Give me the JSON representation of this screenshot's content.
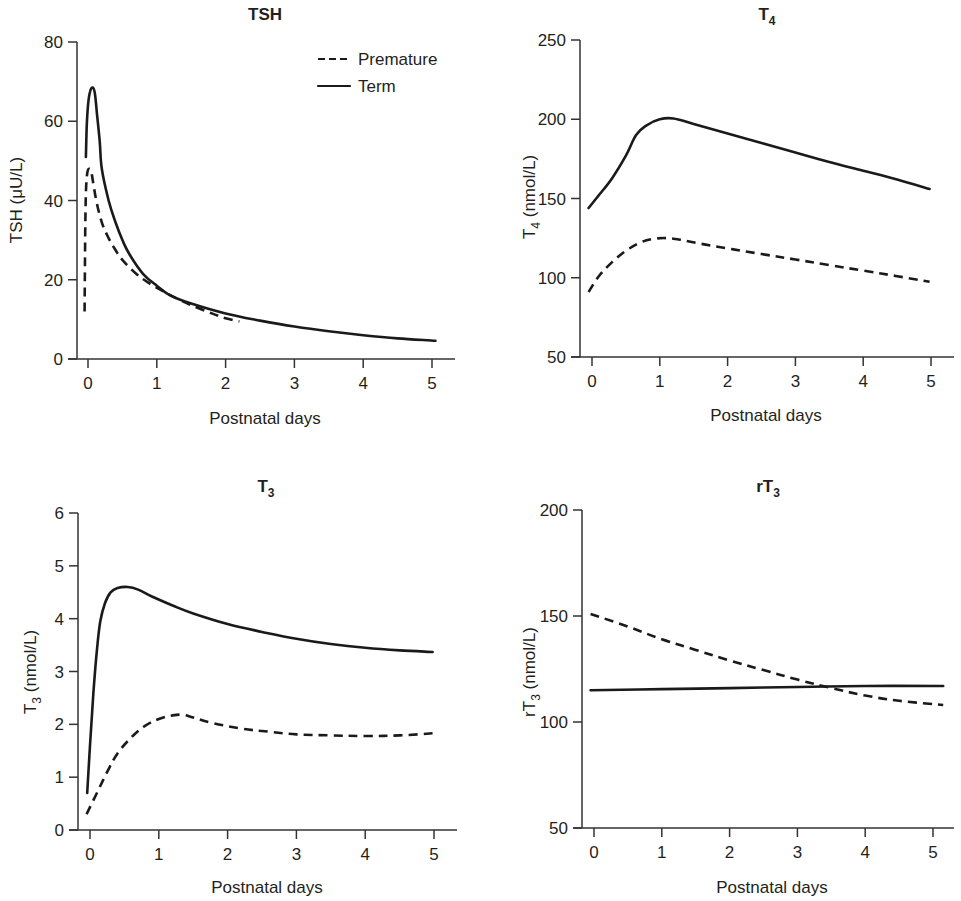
{
  "chart_data": [
    {
      "id": "tsh",
      "type": "line",
      "title": "TSH",
      "title_sub": "",
      "xlabel": "Postnatal days",
      "ylabel": "TSH (μU/L)",
      "ylabel_main": "TSH (",
      "ylabel_sub": "",
      "ylabel_rest": "μU/L)",
      "xlim": [
        0,
        5
      ],
      "ylim": [
        0,
        80
      ],
      "xticks": [
        0,
        1,
        2,
        3,
        4,
        5
      ],
      "yticks": [
        0,
        20,
        40,
        60,
        80
      ],
      "grid": false,
      "legend": {
        "position": "upper right",
        "entries": [
          {
            "label": "Premature",
            "style": "dashed"
          },
          {
            "label": "Term",
            "style": "solid"
          }
        ]
      },
      "series": [
        {
          "name": "Term",
          "style": "solid",
          "x": [
            -0.03,
            -0.02,
            0.0,
            0.03,
            0.07,
            0.1,
            0.13,
            0.17,
            0.2,
            0.3,
            0.4,
            0.5,
            0.6,
            0.8,
            1.0,
            1.2,
            1.5,
            2.0,
            2.5,
            3.0,
            3.5,
            4.0,
            4.5,
            5.05
          ],
          "y": [
            51,
            58,
            64,
            67.5,
            68.5,
            67,
            62,
            55,
            48,
            40,
            34.5,
            30,
            26.5,
            21.5,
            18.5,
            16,
            14,
            11.5,
            9.7,
            8.2,
            7,
            6,
            5.2,
            4.6
          ]
        },
        {
          "name": "Premature",
          "style": "dashed",
          "x": [
            -0.05,
            -0.045,
            -0.04,
            -0.03,
            -0.01,
            0.02,
            0.05,
            0.08,
            0.12,
            0.2,
            0.3,
            0.4,
            0.5,
            0.7,
            0.9,
            1.1,
            1.3,
            1.5,
            1.8,
            2.0,
            2.2
          ],
          "y": [
            12,
            22,
            32,
            42,
            47,
            48,
            47,
            44,
            40,
            34.5,
            30.5,
            27.5,
            25,
            21.5,
            19,
            17,
            15.2,
            13.6,
            11.5,
            10.3,
            9.5
          ]
        }
      ]
    },
    {
      "id": "t4",
      "type": "line",
      "title": "T",
      "title_sub": "4",
      "xlabel": "Postnatal days",
      "ylabel": "T4 (nmol/L)",
      "ylabel_main": "T",
      "ylabel_sub": "4",
      "ylabel_rest": " (nmol/L)",
      "xlim": [
        0,
        5
      ],
      "ylim": [
        50,
        250
      ],
      "xticks": [
        0,
        1,
        2,
        3,
        4,
        5
      ],
      "yticks": [
        50,
        100,
        150,
        200,
        250
      ],
      "grid": false,
      "series": [
        {
          "name": "Term",
          "style": "solid",
          "x": [
            -0.05,
            0.1,
            0.3,
            0.5,
            0.65,
            0.8,
            1.0,
            1.2,
            1.5,
            2.0,
            2.5,
            3.0,
            3.5,
            4.0,
            4.5,
            4.98
          ],
          "y": [
            144,
            152,
            163,
            177,
            190,
            196,
            200,
            200.5,
            197,
            191,
            185,
            179,
            173,
            167.5,
            162,
            156
          ]
        },
        {
          "name": "Premature",
          "style": "dashed",
          "x": [
            -0.05,
            0.1,
            0.3,
            0.5,
            0.7,
            0.9,
            1.1,
            1.3,
            1.6,
            2.0,
            2.5,
            3.0,
            3.5,
            4.0,
            4.5,
            4.98
          ],
          "y": [
            91,
            101,
            110,
            117,
            122,
            124.5,
            125,
            124,
            121.5,
            118.5,
            115,
            111.5,
            108,
            104.5,
            101,
            97.5
          ]
        }
      ]
    },
    {
      "id": "t3",
      "type": "line",
      "title": "T",
      "title_sub": "3",
      "xlabel": "Postnatal days",
      "ylabel": "T3 (nmol/L)",
      "ylabel_main": "T",
      "ylabel_sub": "3",
      "ylabel_rest": " (nmol/L)",
      "xlim": [
        0,
        5
      ],
      "ylim": [
        0,
        6
      ],
      "xticks": [
        0,
        1,
        2,
        3,
        4,
        5
      ],
      "yticks": [
        0,
        1,
        2,
        3,
        4,
        5,
        6
      ],
      "grid": false,
      "series": [
        {
          "name": "Term",
          "style": "solid",
          "x": [
            -0.04,
            0.0,
            0.05,
            0.1,
            0.15,
            0.22,
            0.3,
            0.4,
            0.55,
            0.7,
            0.9,
            1.2,
            1.5,
            2.0,
            2.5,
            3.0,
            3.5,
            4.0,
            4.5,
            4.98
          ],
          "y": [
            0.7,
            1.6,
            2.6,
            3.4,
            3.95,
            4.3,
            4.5,
            4.58,
            4.6,
            4.55,
            4.42,
            4.25,
            4.1,
            3.9,
            3.75,
            3.62,
            3.52,
            3.45,
            3.4,
            3.37
          ]
        },
        {
          "name": "Premature",
          "style": "dashed",
          "x": [
            -0.05,
            0.1,
            0.25,
            0.4,
            0.6,
            0.8,
            1.0,
            1.2,
            1.35,
            1.5,
            1.8,
            2.2,
            2.6,
            3.0,
            3.5,
            4.0,
            4.5,
            4.98
          ],
          "y": [
            0.3,
            0.7,
            1.1,
            1.45,
            1.75,
            1.97,
            2.1,
            2.17,
            2.18,
            2.13,
            2.02,
            1.92,
            1.86,
            1.81,
            1.79,
            1.78,
            1.79,
            1.83
          ]
        }
      ]
    },
    {
      "id": "rt3",
      "type": "line",
      "title": "rT",
      "title_sub": "3",
      "xlabel": "Postnatal days",
      "ylabel": "rT3 (nmol/L)",
      "ylabel_main": "rT",
      "ylabel_sub": "3",
      "ylabel_rest": " (nmol/L)",
      "xlim": [
        0,
        5
      ],
      "ylim": [
        50,
        200
      ],
      "xticks": [
        0,
        1,
        2,
        3,
        4,
        5
      ],
      "yticks": [
        50,
        100,
        150,
        200
      ],
      "grid": false,
      "series": [
        {
          "name": "Term",
          "style": "solid",
          "x": [
            -0.05,
            1.0,
            2.0,
            3.0,
            4.0,
            5.15
          ],
          "y": [
            115,
            115.5,
            116,
            116.5,
            117,
            117
          ]
        },
        {
          "name": "Premature",
          "style": "dashed",
          "x": [
            -0.05,
            0.5,
            1.0,
            1.5,
            2.0,
            2.5,
            3.0,
            3.5,
            4.0,
            4.5,
            5.15
          ],
          "y": [
            151,
            145,
            139,
            134,
            129,
            124.5,
            120,
            116,
            112.5,
            110,
            108
          ]
        }
      ]
    }
  ],
  "legend": {
    "premature_label": "Premature",
    "term_label": "Term"
  },
  "panels": {
    "tsh": {
      "title": "TSH"
    },
    "t4": {
      "title": "T",
      "title_sub": "4"
    },
    "t3": {
      "title": "T",
      "title_sub": "3"
    },
    "rt3": {
      "title": "rT",
      "title_sub": "3"
    }
  }
}
